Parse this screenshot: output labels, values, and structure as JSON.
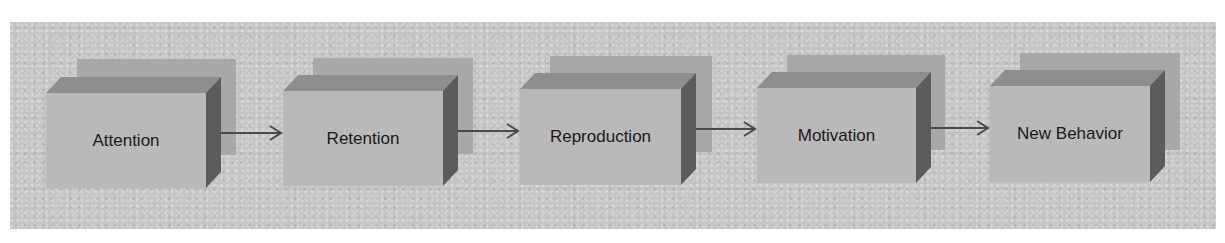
{
  "diagram": {
    "type": "process-flow",
    "colors": {
      "background": "#c4c4c4",
      "shadow": "#a8a8a8",
      "front_face": "#b9b9b9",
      "top_face": "#8e8e8e",
      "side_face": "#5c5c5c",
      "arrow": "#4a4a4a",
      "text": "#1a1a1a"
    },
    "steps": [
      {
        "label": "Attention"
      },
      {
        "label": "Retention"
      },
      {
        "label": "Reproduction"
      },
      {
        "label": "Motivation"
      },
      {
        "label": "New Behavior"
      }
    ],
    "connectors": [
      {
        "from": "Attention",
        "to": "Retention"
      },
      {
        "from": "Retention",
        "to": "Reproduction"
      },
      {
        "from": "Reproduction",
        "to": "Motivation"
      },
      {
        "from": "Motivation",
        "to": "New Behavior"
      }
    ]
  }
}
